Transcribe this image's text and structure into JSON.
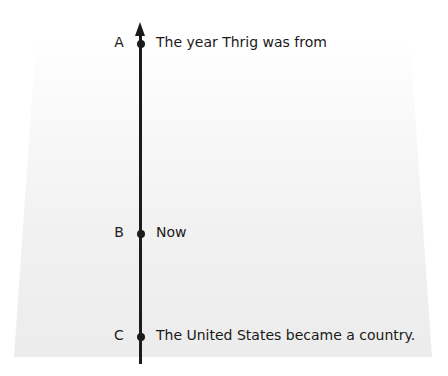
{
  "diagram": {
    "type": "timeline",
    "orientation": "vertical",
    "arrow_direction": "up",
    "points": [
      {
        "letter": "A",
        "label": "The year Thrig was from"
      },
      {
        "letter": "B",
        "label": "Now"
      },
      {
        "letter": "C",
        "label": "The United States became a country."
      }
    ],
    "colors": {
      "line": "#1b1b1b",
      "background_shape": "#eeeeee",
      "text": "#1a1a1a"
    }
  }
}
